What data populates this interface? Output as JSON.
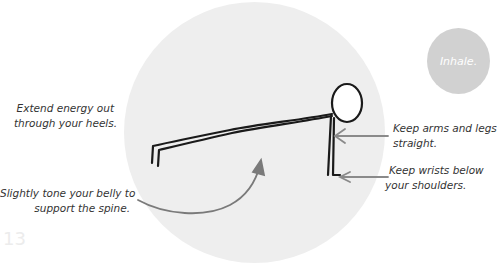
{
  "page": {
    "number": "13",
    "colors": {
      "background": "#ffffff",
      "big_circle": "#eeeeee",
      "inhale_circle": "#d1d1d1",
      "text": "#333333",
      "arrow": "#8a8a8a",
      "figure_stroke": "#1a1a1a"
    }
  },
  "breath": {
    "label": "Inhale."
  },
  "annotations": {
    "heels": {
      "line1": "Extend energy out",
      "line2": "through your heels."
    },
    "belly": {
      "line1": "Slightly tone your belly to",
      "line2": "support the spine."
    },
    "arms": {
      "line1": "Keep arms and legs",
      "line2": "straight."
    },
    "wrists": {
      "line1": "Keep wrists below",
      "line2": "your shoulders."
    }
  },
  "illustration": {
    "pose": "plank",
    "figure": "stick-figure",
    "icons": [
      "stick-figure-plank-icon",
      "arrow-left-icon",
      "curved-arrow-icon"
    ]
  }
}
